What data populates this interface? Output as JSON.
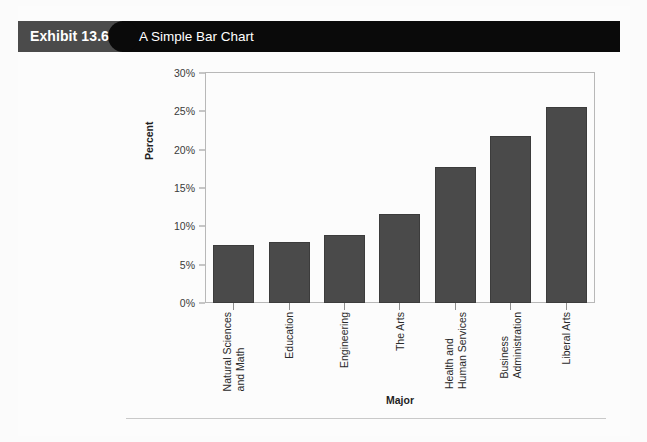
{
  "exhibit": {
    "number_label": "Exhibit 13.6",
    "title": "A Simple Bar Chart"
  },
  "colors": {
    "header_black": "#0a0a0a",
    "header_gray": "#4b4b4b",
    "bar_fill": "#4a4a4a",
    "axis_line": "#b8b8b8",
    "page_background": "#fcfcfc"
  },
  "chart_data": {
    "type": "bar",
    "title": "A Simple Bar Chart",
    "xlabel": "Major",
    "ylabel": "Percent",
    "ylim": [
      0,
      30
    ],
    "grid": false,
    "legend": "none",
    "ytick_labels": [
      "0%",
      "5%",
      "10%",
      "15%",
      "20%",
      "25%",
      "30%"
    ],
    "ytick_values": [
      0,
      5,
      10,
      15,
      20,
      25,
      30
    ],
    "categories": [
      "Natural Sciences\nand Math",
      "Education",
      "Engineering",
      "The Arts",
      "Health and\nHuman Services",
      "Business\nAdministration",
      "Liberal Arts"
    ],
    "values": [
      7.6,
      7.9,
      8.9,
      11.6,
      17.7,
      21.8,
      25.6
    ]
  }
}
